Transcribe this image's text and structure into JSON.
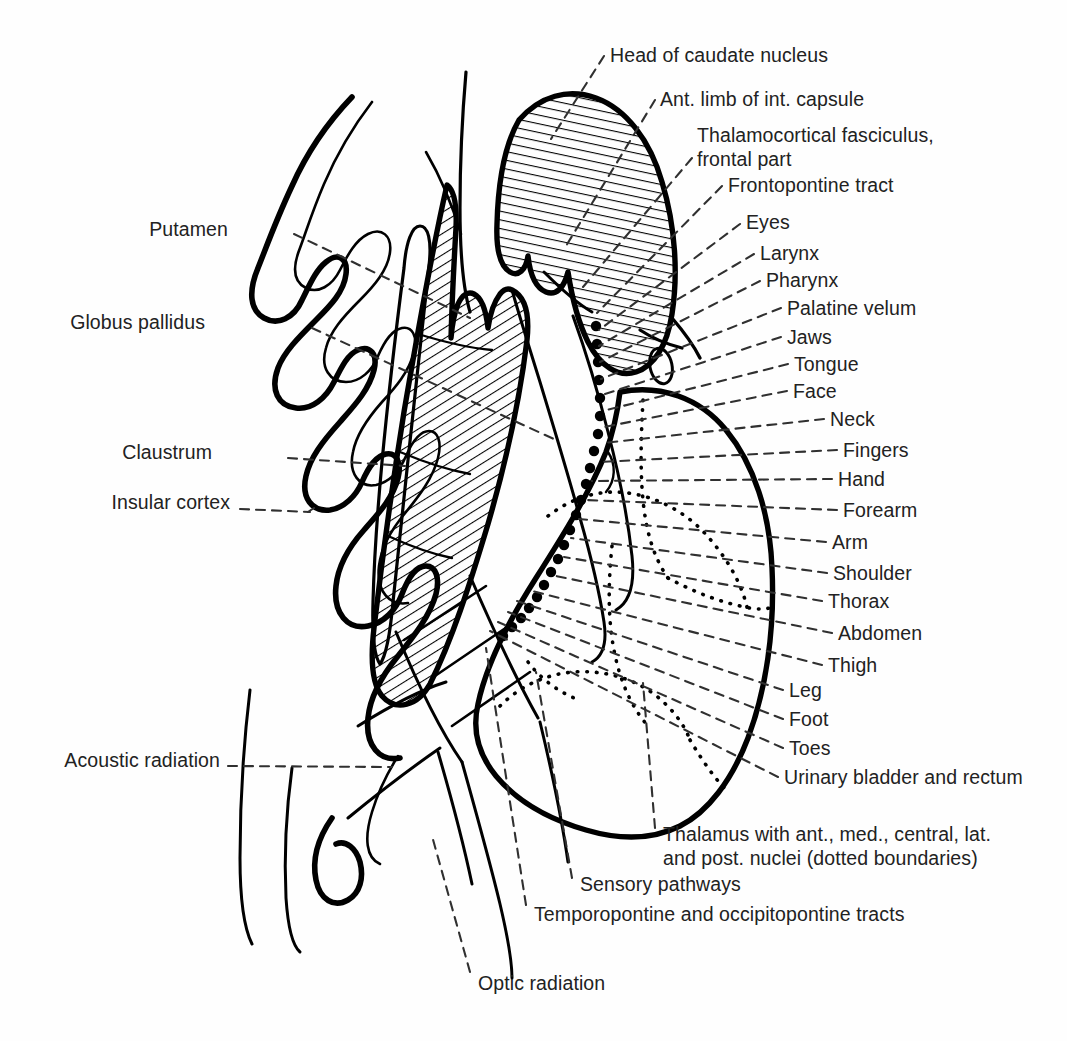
{
  "figure": {
    "background_color": "#ffffff",
    "ink_color": "#000000",
    "text_color": "#222222",
    "width": 1067,
    "height": 1041
  },
  "labels_left": [
    {
      "id": "putamen",
      "text": "Putamen",
      "x": 228,
      "y": 229,
      "anchor_x": 470,
      "anchor_y": 318,
      "leader": "dashed"
    },
    {
      "id": "globus-pallidus",
      "text": "Globus pallidus",
      "x": 205,
      "y": 322,
      "anchor_x": 556,
      "anchor_y": 440,
      "leader": "dashed"
    },
    {
      "id": "claustrum",
      "text": "Claustrum",
      "x": 212,
      "y": 452,
      "anchor_x": 405,
      "anchor_y": 466,
      "leader": "dashed"
    },
    {
      "id": "insular-cortex",
      "text": "Insular cortex",
      "x": 230,
      "y": 502,
      "anchor_x": 308,
      "anchor_y": 512,
      "leader": "dashed"
    },
    {
      "id": "acoustic-radiation",
      "text": "Acoustic radiation",
      "x": 220,
      "y": 760,
      "anchor_x": 392,
      "anchor_y": 767,
      "leader": "dashed"
    }
  ],
  "labels_right": [
    {
      "id": "head-of-caudate-nucleus",
      "text": "Head of caudate nucleus",
      "x": 610,
      "y": 48,
      "anchor_x": 551,
      "anchor_y": 139,
      "leader": "dashed"
    },
    {
      "id": "ant-limb-int-capsule",
      "text": "Ant. limb of int. capsule",
      "x": 660,
      "y": 92,
      "anchor_x": 566,
      "anchor_y": 246,
      "leader": "dashed"
    },
    {
      "id": "thalamocortical-fasciculus",
      "text": "Thalamocortical fasciculus,\nfrontal part",
      "x": 697,
      "y": 127,
      "anchor_x": 583,
      "anchor_y": 287,
      "leader": "dashed"
    },
    {
      "id": "frontopontine-tract",
      "text": "Frontopontine tract",
      "x": 728,
      "y": 178,
      "anchor_x": 595,
      "anchor_y": 312,
      "leader": "dashed"
    },
    {
      "id": "eyes",
      "text": "Eyes",
      "x": 746,
      "y": 215,
      "anchor_x": 600,
      "anchor_y": 331,
      "leader": "dashed"
    },
    {
      "id": "larynx",
      "text": "Larynx",
      "x": 760,
      "y": 246,
      "anchor_x": 600,
      "anchor_y": 347,
      "leader": "dashed"
    },
    {
      "id": "pharynx",
      "text": "Pharynx",
      "x": 766,
      "y": 273,
      "anchor_x": 601,
      "anchor_y": 363,
      "leader": "dashed"
    },
    {
      "id": "palatine-velum",
      "text": "Palatine velum",
      "x": 787,
      "y": 301,
      "anchor_x": 602,
      "anchor_y": 379,
      "leader": "dashed"
    },
    {
      "id": "jaws",
      "text": "Jaws",
      "x": 787,
      "y": 330,
      "anchor_x": 603,
      "anchor_y": 395,
      "leader": "dashed"
    },
    {
      "id": "tongue",
      "text": "Tongue",
      "x": 794,
      "y": 357,
      "anchor_x": 604,
      "anchor_y": 411,
      "leader": "dashed"
    },
    {
      "id": "face",
      "text": "Face",
      "x": 793,
      "y": 384,
      "anchor_x": 605,
      "anchor_y": 427,
      "leader": "dashed"
    },
    {
      "id": "neck",
      "text": "Neck",
      "x": 830,
      "y": 412,
      "anchor_x": 606,
      "anchor_y": 443,
      "leader": "dashed"
    },
    {
      "id": "fingers",
      "text": "Fingers",
      "x": 843,
      "y": 443,
      "anchor_x": 601,
      "anchor_y": 462,
      "leader": "dashed"
    },
    {
      "id": "hand",
      "text": "Hand",
      "x": 838,
      "y": 472,
      "anchor_x": 594,
      "anchor_y": 481,
      "leader": "dashed"
    },
    {
      "id": "forearm",
      "text": "Forearm",
      "x": 843,
      "y": 503,
      "anchor_x": 588,
      "anchor_y": 500,
      "leader": "dashed"
    },
    {
      "id": "arm",
      "text": "Arm",
      "x": 832,
      "y": 535,
      "anchor_x": 581,
      "anchor_y": 519,
      "leader": "dashed"
    },
    {
      "id": "shoulder",
      "text": "Shoulder",
      "x": 833,
      "y": 566,
      "anchor_x": 573,
      "anchor_y": 538,
      "leader": "dashed"
    },
    {
      "id": "thorax",
      "text": "Thorax",
      "x": 828,
      "y": 594,
      "anchor_x": 566,
      "anchor_y": 557,
      "leader": "dashed"
    },
    {
      "id": "abdomen",
      "text": "Abdomen",
      "x": 838,
      "y": 626,
      "anchor_x": 558,
      "anchor_y": 576,
      "leader": "dashed"
    },
    {
      "id": "thigh",
      "text": "Thigh",
      "x": 828,
      "y": 658,
      "anchor_x": 530,
      "anchor_y": 590,
      "leader": "dashed"
    },
    {
      "id": "leg",
      "text": "Leg",
      "x": 789,
      "y": 683,
      "anchor_x": 519,
      "anchor_y": 601,
      "leader": "dashed"
    },
    {
      "id": "foot",
      "text": "Foot",
      "x": 789,
      "y": 712,
      "anchor_x": 510,
      "anchor_y": 612,
      "leader": "dashed"
    },
    {
      "id": "toes",
      "text": "Toes",
      "x": 789,
      "y": 741,
      "anchor_x": 500,
      "anchor_y": 622,
      "leader": "dashed"
    },
    {
      "id": "urinary-bladder-and-rectum",
      "text": "Urinary bladder and rectum",
      "x": 784,
      "y": 770,
      "anchor_x": 492,
      "anchor_y": 631,
      "leader": "dashed"
    }
  ],
  "labels_bottom": [
    {
      "id": "thalamus-nuclei",
      "text": "Thalamus with ant., med., central, lat.\nand post. nuclei (dotted boundaries)",
      "x": 663,
      "y": 826,
      "anchor_x": 643,
      "anchor_y": 683,
      "leader": "dashed"
    },
    {
      "id": "sensory-pathways",
      "text": "Sensory pathways",
      "x": 580,
      "y": 877,
      "anchor_x": 536,
      "anchor_y": 672,
      "leader": "dashed"
    },
    {
      "id": "temporopontine-occipitopontine",
      "text": "Temporopontine and occipitopontine tracts",
      "x": 534,
      "y": 907,
      "anchor_x": 486,
      "anchor_y": 648,
      "leader": "dashed"
    },
    {
      "id": "optic-radiation",
      "text": "Optic radiation",
      "x": 478,
      "y": 976,
      "anchor_x": 432,
      "anchor_y": 836,
      "leader": "dashed"
    }
  ],
  "structures": [
    {
      "id": "insular-cortex-outline",
      "kind": "gyral-outline",
      "fill": "none",
      "stroke": "#000000"
    },
    {
      "id": "claustrum-band",
      "kind": "thin-band",
      "fill": "none",
      "stroke": "#000000"
    },
    {
      "id": "lentiform-nucleus",
      "kind": "hatched-wedge",
      "hatch_angle_deg": 58,
      "stroke": "#000000"
    },
    {
      "id": "head-of-caudate",
      "kind": "hatched-oval",
      "hatch_angle_deg": 12,
      "stroke": "#000000"
    },
    {
      "id": "internal-capsule",
      "kind": "band-with-segments",
      "stroke": "#000000"
    },
    {
      "id": "thalamus",
      "kind": "closed-outline-with-dotted-nuclei",
      "stroke": "#000000"
    },
    {
      "id": "optic-tract-oval",
      "kind": "small-oval",
      "stroke": "#000000"
    },
    {
      "id": "corticospinal-dot-row",
      "kind": "dot-row",
      "count": 22,
      "fill": "#000000"
    }
  ]
}
